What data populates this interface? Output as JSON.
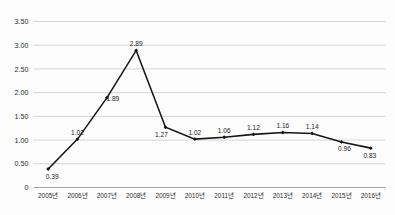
{
  "chart_data": {
    "type": "line",
    "title": "",
    "subtitle": "",
    "xlabel": "",
    "ylabel": "",
    "categories": [
      "2005년",
      "2006년",
      "2007년",
      "2008년",
      "2009년",
      "2010년",
      "2011년",
      "2012년",
      "2013년",
      "2014년",
      "2015년",
      "2016년"
    ],
    "values": [
      0.39,
      1.02,
      1.89,
      2.89,
      1.27,
      1.02,
      1.06,
      1.12,
      1.16,
      1.14,
      0.96,
      0.83
    ],
    "data_labels": [
      "0.39",
      "1.02",
      "1.89",
      "2.89",
      "1.27",
      "1.02",
      "1.06",
      "1.12",
      "1.16",
      "1.14",
      "0.96",
      "0.83"
    ],
    "label_positions": [
      "below",
      "above",
      "above",
      "above",
      "below",
      "above",
      "above",
      "above",
      "above",
      "above",
      "below",
      "below"
    ],
    "series": [
      {
        "name": "",
        "values": [
          0.39,
          1.02,
          1.89,
          2.89,
          1.27,
          1.02,
          1.06,
          1.12,
          1.16,
          1.14,
          0.96,
          0.83
        ]
      }
    ],
    "ylim": [
      0,
      3.5
    ],
    "ytick_labels": [
      "0",
      "0.50",
      "1.00",
      "1.50",
      "2.00",
      "2.50",
      "3.00",
      "3.50"
    ],
    "ytick_values": [
      0,
      0.5,
      1.0,
      1.5,
      2.0,
      2.5,
      3.0,
      3.5
    ],
    "grid": true,
    "grid_axis": "y",
    "legend": false,
    "legend_position": "none",
    "marker": "diamond",
    "colors": {
      "line": "#161616",
      "marker": "#161616",
      "grid": "#c9c9c9",
      "axis": "#9a9a9a",
      "text": "#2b2b2b",
      "background": "#fdfdfd"
    }
  }
}
